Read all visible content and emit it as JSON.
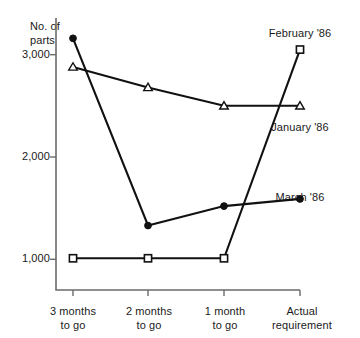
{
  "chart_data": {
    "type": "line",
    "title": "",
    "subtitle": "",
    "xlabel": "",
    "ylabel": "No. of\nparts",
    "ylabel_line1": "No. of",
    "ylabel_line2": "parts",
    "categories": [
      "3 months\nto go",
      "2 months\nto go",
      "1 month\nto go",
      "Actual\nrequirement"
    ],
    "category_labels": [
      {
        "line1": "3 months",
        "line2": "to go"
      },
      {
        "line1": "2 months",
        "line2": "to go"
      },
      {
        "line1": "1 month",
        "line2": "to go"
      },
      {
        "line1": "Actual",
        "line2": "requirement"
      }
    ],
    "yticks": [
      1000,
      2000,
      3000
    ],
    "ytick_labels": [
      "1,000",
      "2,000",
      "3,000"
    ],
    "ylim": [
      700,
      3300
    ],
    "grid": false,
    "legend_position": "inline-annotations",
    "series": [
      {
        "name": "February '86",
        "label": "February '86",
        "marker": "square",
        "values": [
          1010,
          1010,
          1010,
          3050
        ],
        "label_x": 300,
        "label_y": 34,
        "label_anchor": "middle"
      },
      {
        "name": "January '86",
        "label": "January '86",
        "marker": "triangle",
        "values": [
          2880,
          2680,
          2500,
          2500
        ],
        "label_x": 300,
        "label_y": 128,
        "label_anchor": "middle"
      },
      {
        "name": "March '86",
        "label": "March '86",
        "marker": "circle",
        "values": [
          3160,
          1330,
          1520,
          1590
        ],
        "label_x": 300,
        "label_y": 198,
        "label_anchor": "middle"
      }
    ],
    "colors": {
      "line": "#111111",
      "axis": "#6b6b6b",
      "text": "#1a1a1a",
      "background": "#ffffff",
      "marker_fill": "#ffffff"
    }
  }
}
